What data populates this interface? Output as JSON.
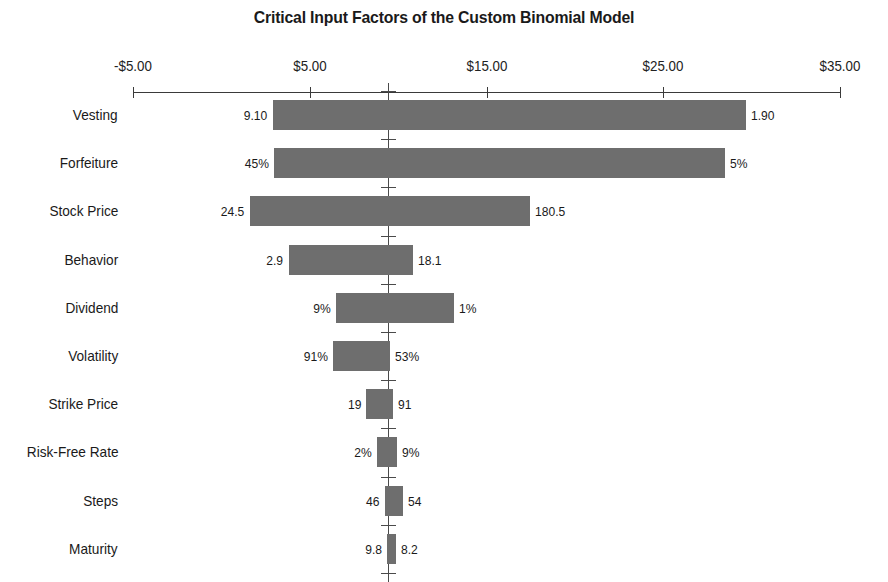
{
  "chart_data": {
    "type": "bar",
    "subtype": "tornado",
    "title": "Critical Input Factors of the Custom Binomial Model",
    "xlabel": "",
    "ylabel": "",
    "grid": false,
    "legend": "none",
    "axis": {
      "position": "top",
      "tick_labels": [
        "-$5.00",
        "$5.00",
        "$15.00",
        "$25.00",
        "$35.00"
      ],
      "tick_values": [
        -5,
        5,
        15,
        25,
        35
      ],
      "xlim": [
        -5,
        35
      ],
      "base_value": 9.45
    },
    "categories": [
      "Vesting",
      "Forfeiture",
      "Stock Price",
      "Behavior",
      "Dividend",
      "Volatility",
      "Strike Price",
      "Risk-Free Rate",
      "Steps",
      "Maturity"
    ],
    "bars": [
      {
        "category": "Vesting",
        "left_label": "9.10",
        "right_label": "1.90",
        "low": 2.9,
        "high": 29.7,
        "span": 26.8
      },
      {
        "category": "Forfeiture",
        "left_label": "45%",
        "right_label": "5%",
        "low": 2.95,
        "high": 28.5,
        "span": 25.55
      },
      {
        "category": "Stock Price",
        "left_label": "24.5",
        "right_label": "180.5",
        "low": 1.6,
        "high": 17.45,
        "span": 15.85
      },
      {
        "category": "Behavior",
        "left_label": "2.9",
        "right_label": "18.1",
        "low": 3.8,
        "high": 10.85,
        "span": 7.05
      },
      {
        "category": "Dividend",
        "left_label": "9%",
        "right_label": "1%",
        "low": 6.5,
        "high": 13.15,
        "span": 6.65
      },
      {
        "category": "Volatility",
        "left_label": "91%",
        "right_label": "53%",
        "low": 6.3,
        "high": 9.55,
        "span": 3.25
      },
      {
        "category": "Strike Price",
        "left_label": "19",
        "right_label": "91",
        "low": 8.2,
        "high": 9.7,
        "span": 1.5
      },
      {
        "category": "Risk-Free Rate",
        "left_label": "2%",
        "right_label": "9%",
        "low": 8.8,
        "high": 9.95,
        "span": 1.15
      },
      {
        "category": "Steps",
        "left_label": "46",
        "right_label": "54",
        "low": 9.25,
        "high": 10.3,
        "span": 1.05
      },
      {
        "category": "Maturity",
        "left_label": "9.8",
        "right_label": "8.2",
        "low": 9.35,
        "high": 9.9,
        "span": 0.55
      }
    ]
  },
  "style": {
    "bar_color": "#6e6e6e",
    "axis_color": "#3a3a3a",
    "text_color": "#1a1a1a",
    "background": "#ffffff"
  }
}
